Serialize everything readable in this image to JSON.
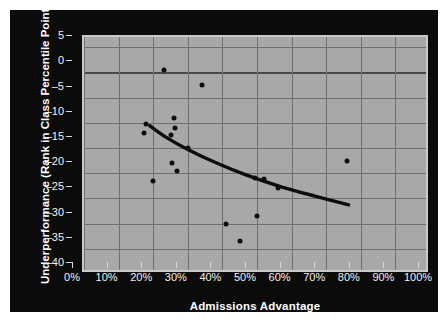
{
  "chart_data": {
    "type": "scatter",
    "title": "",
    "xlabel": "Admissions Advantage",
    "ylabel": "Underperformance (Rank in Class Percentile Points)",
    "xlim": [
      0,
      100
    ],
    "ylim": [
      -40,
      7
    ],
    "grid": true,
    "legend": null,
    "x_tick_labels": [
      "0%",
      "10%",
      "20%",
      "30%",
      "40%",
      "50%",
      "60%",
      "70%",
      "80%",
      "90%",
      "100%"
    ],
    "x_tick_values": [
      0,
      10,
      20,
      30,
      40,
      50,
      60,
      70,
      80,
      90,
      100
    ],
    "y_tick_labels": [
      "5",
      "0",
      "-5",
      "-10",
      "-15",
      "-20",
      "-25",
      "-30",
      "-35",
      "-40"
    ],
    "y_tick_values": [
      5,
      0,
      -5,
      -10,
      -15,
      -20,
      -25,
      -30,
      -35,
      -40
    ],
    "points": [
      {
        "x": 23.0,
        "y": 0.5
      },
      {
        "x": 34.0,
        "y": -2.5
      },
      {
        "x": 26.0,
        "y": -9.0
      },
      {
        "x": 17.8,
        "y": -10.3
      },
      {
        "x": 26.2,
        "y": -11.0
      },
      {
        "x": 17.3,
        "y": -12.0
      },
      {
        "x": 25.2,
        "y": -12.5
      },
      {
        "x": 30.0,
        "y": -15.0
      },
      {
        "x": 25.5,
        "y": -18.0
      },
      {
        "x": 26.8,
        "y": -19.5
      },
      {
        "x": 20.0,
        "y": -21.5
      },
      {
        "x": 49.5,
        "y": -21.0
      },
      {
        "x": 52.0,
        "y": -21.2
      },
      {
        "x": 56.0,
        "y": -23.0
      },
      {
        "x": 76.0,
        "y": -17.5
      },
      {
        "x": 41.0,
        "y": -30.0
      },
      {
        "x": 50.0,
        "y": -28.5
      },
      {
        "x": 45.0,
        "y": -33.5
      }
    ],
    "trendline": {
      "name": "fitted-curve",
      "style": "solid",
      "color": "#0d0d0d",
      "points": [
        {
          "x": 19.0,
          "y": -10.6
        },
        {
          "x": 24.0,
          "y": -13.0
        },
        {
          "x": 30.0,
          "y": -15.3
        },
        {
          "x": 38.0,
          "y": -17.9
        },
        {
          "x": 47.0,
          "y": -20.4
        },
        {
          "x": 57.0,
          "y": -22.7
        },
        {
          "x": 67.0,
          "y": -24.6
        },
        {
          "x": 76.5,
          "y": -26.3
        }
      ]
    },
    "colors": {
      "panel_background": "#0b0b0b",
      "plot_background": "#a8a8a8",
      "gridline": "#6f6f6f",
      "point": "#0d0d0d",
      "axis_text": "#f2f2f2",
      "title_text": "#ffffff",
      "plot_border": "#c9c9c9"
    }
  }
}
